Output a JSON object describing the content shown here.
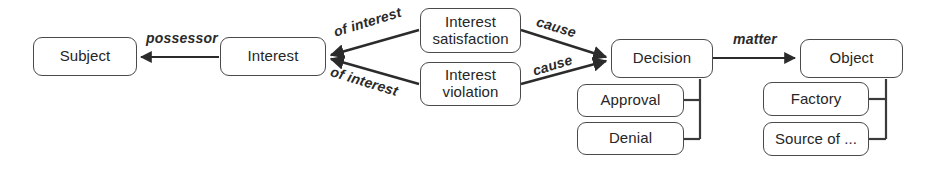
{
  "diagram": {
    "stroke_color": "#4a4a4a",
    "text_color": "#262626",
    "background": "#ffffff",
    "nodes": [
      {
        "id": "subject",
        "label_line1": "Subject",
        "label_line2": ""
      },
      {
        "id": "interest",
        "label_line1": "Interest",
        "label_line2": ""
      },
      {
        "id": "interest-satisfaction",
        "label_line1": "Interest",
        "label_line2": "satisfaction"
      },
      {
        "id": "interest-violation",
        "label_line1": "Interest",
        "label_line2": "violation"
      },
      {
        "id": "decision",
        "label_line1": "Decision",
        "label_line2": ""
      },
      {
        "id": "approval",
        "label_line1": "Approval",
        "label_line2": ""
      },
      {
        "id": "denial",
        "label_line1": "Denial",
        "label_line2": ""
      },
      {
        "id": "object",
        "label_line1": "Object",
        "label_line2": ""
      },
      {
        "id": "factory",
        "label_line1": "Factory",
        "label_line2": ""
      },
      {
        "id": "source-of",
        "label_line1": "Source of ...",
        "label_line2": ""
      }
    ],
    "edge_labels": [
      {
        "id": "possessor",
        "text": "possessor"
      },
      {
        "id": "of-interest-upper",
        "text": "of interest"
      },
      {
        "id": "of-interest-lower",
        "text": "of interest"
      },
      {
        "id": "cause-upper",
        "text": "cause"
      },
      {
        "id": "cause-lower",
        "text": "cause"
      },
      {
        "id": "matter",
        "text": "matter"
      }
    ]
  }
}
